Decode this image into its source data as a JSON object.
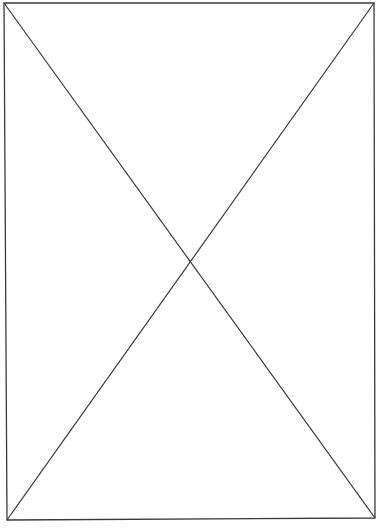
{
  "placeholder": {
    "kind": "image-placeholder",
    "stroke_color": "#3a3a3a",
    "background_color": "#ffffff",
    "frame": {
      "top_left": [
        4,
        3
      ],
      "top_right": [
        374,
        3
      ],
      "bottom_right": [
        375,
        518
      ],
      "bottom_left": [
        7,
        520
      ]
    },
    "diagonals": [
      {
        "from": [
          4,
          3
        ],
        "to": [
          375,
          518
        ]
      },
      {
        "from": [
          374,
          3
        ],
        "to": [
          7,
          520
        ]
      }
    ],
    "intersection": [
      191,
      260
    ]
  }
}
